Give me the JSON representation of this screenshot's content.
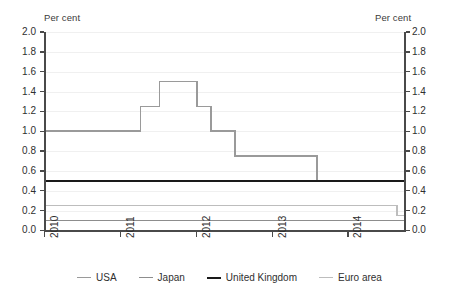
{
  "axes": {
    "unit_label_left": "Per cent",
    "unit_label_right": "Per cent"
  },
  "legend": {
    "items": [
      {
        "label": "USA",
        "color": "#9a9a9a",
        "width": 1.6
      },
      {
        "label": "Japan",
        "color": "#8d8d8d",
        "width": 1.6
      },
      {
        "label": "United Kingdom",
        "color": "#1a1a1a",
        "width": 2.2
      },
      {
        "label": "Euro area",
        "color": "#bdbdbd",
        "width": 1.6
      }
    ]
  },
  "chart_data": {
    "type": "line",
    "title": "",
    "subtitle": "",
    "xlabel": "",
    "ylabel": "Per cent",
    "y2label": "Per cent",
    "grid": true,
    "legend_position": "bottom",
    "step": "post",
    "xlim": [
      2010.0,
      2014.75
    ],
    "ylim": [
      0.0,
      2.0
    ],
    "ytick_values": [
      0.0,
      0.2,
      0.4,
      0.6,
      0.8,
      1.0,
      1.2,
      1.4,
      1.6,
      1.8,
      2.0
    ],
    "ytick_labels": [
      "0.0",
      "0.2",
      "0.4",
      "0.6",
      "0.8",
      "1.0",
      "1.2",
      "1.4",
      "1.6",
      "1.8",
      "2.0"
    ],
    "ytick_labels_right": [
      "0.0",
      "0.2",
      "0.4",
      "0.6",
      "0.8",
      "1.0",
      "1.2",
      "1.4",
      "1.6",
      "1.8",
      "2.0"
    ],
    "xtick_values": [
      2010,
      2011,
      2012,
      2013,
      2014
    ],
    "xtick_labels": [
      "2010",
      "2011",
      "2012",
      "2013",
      "2014"
    ],
    "series": [
      {
        "name": "USA",
        "color": "#9a9a9a",
        "width": 1.6,
        "x": [
          2010.0,
          2011.27,
          2011.52,
          2012.02,
          2012.2,
          2012.52,
          2013.6,
          2014.75
        ],
        "values": [
          1.0,
          1.25,
          1.5,
          1.25,
          1.0,
          0.75,
          0.5,
          0.5
        ]
      },
      {
        "name": "Japan",
        "color": "#8d8d8d",
        "width": 1.6,
        "x": [
          2010.0,
          2014.62,
          2014.75
        ],
        "values": [
          0.1,
          0.1,
          0.1
        ]
      },
      {
        "name": "United Kingdom",
        "color": "#1a1a1a",
        "width": 2.2,
        "x": [
          2010.0,
          2014.75
        ],
        "values": [
          0.5,
          0.5
        ]
      },
      {
        "name": "Euro area",
        "color": "#bdbdbd",
        "width": 1.6,
        "x": [
          2010.0,
          2014.3,
          2014.65,
          2014.75
        ],
        "values": [
          0.25,
          0.25,
          0.15,
          0.05
        ]
      }
    ]
  }
}
